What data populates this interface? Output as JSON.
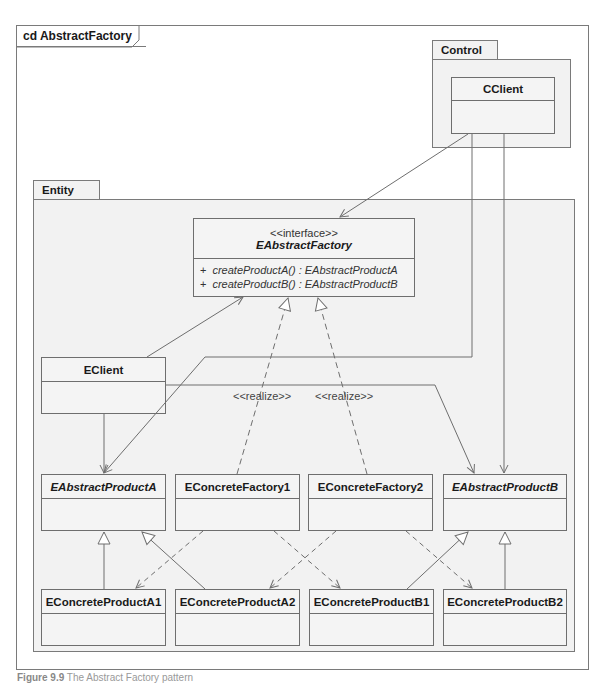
{
  "frame": {
    "label": "cd AbstractFactory"
  },
  "packages": {
    "control": {
      "label": "Control"
    },
    "entity": {
      "label": "Entity"
    }
  },
  "classes": {
    "cclient": {
      "name": "CClient"
    },
    "eabstractfactory": {
      "stereotype": "<<interface>>",
      "name": "EAbstractFactory",
      "operations": [
        {
          "visibility": "+",
          "signature": "createProductA() : EAbstractProductA"
        },
        {
          "visibility": "+",
          "signature": "createProductB() : EAbstractProductB"
        }
      ]
    },
    "eclient": {
      "name": "EClient"
    },
    "eabstractproducta": {
      "name": "EAbstractProductA"
    },
    "econcretefactory1": {
      "name": "EConcreteFactory1"
    },
    "econcretefactory2": {
      "name": "EConcreteFactory2"
    },
    "eabstractproductb": {
      "name": "EAbstractProductB"
    },
    "econcreteproducta1": {
      "name": "EConcreteProductA1"
    },
    "econcreteproducta2": {
      "name": "EConcreteProductA2"
    },
    "econcreteproductb1": {
      "name": "EConcreteProductB1"
    },
    "econcreteproductb2": {
      "name": "EConcreteProductB2"
    }
  },
  "relations": {
    "realize1_label": "<<realize>>",
    "realize2_label": "<<realize>>"
  },
  "caption": {
    "prefix": "Figure 9.9",
    "text": "The Abstract Factory pattern"
  },
  "colors": {
    "line": "#6e6e6e",
    "fill": "#f2f2f2",
    "frame": "#7a7a7a"
  }
}
